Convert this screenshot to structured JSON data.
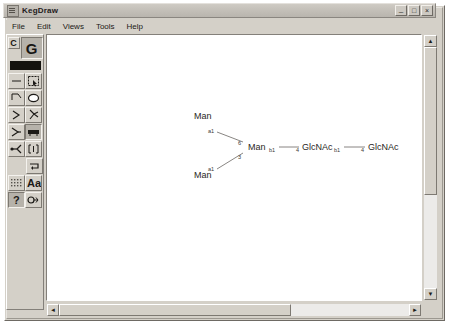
{
  "window": {
    "title": "KegDraw",
    "icon": "app-icon",
    "buttons": {
      "minimize": "–",
      "maximize": "□",
      "close": "×"
    }
  },
  "menubar": {
    "items": [
      {
        "label": "File"
      },
      {
        "label": "Edit"
      },
      {
        "label": "Views"
      },
      {
        "label": "Tools"
      },
      {
        "label": "Help"
      }
    ]
  },
  "toolbar": {
    "mode_compound": "C",
    "mode_glycan": "G",
    "tools": [
      {
        "name": "single-bond-tool",
        "icon": "horizontal-line-icon"
      },
      {
        "name": "select-rectangle-tool",
        "icon": "dashed-rectangle-icon"
      },
      {
        "name": "bond-angle-tool",
        "icon": "corner-bond-icon"
      },
      {
        "name": "ring-tool",
        "icon": "hexagon-ring-icon"
      },
      {
        "name": "branch-tool",
        "icon": "branch-arrow-icon"
      },
      {
        "name": "lasso-tool",
        "icon": "lasso-icon"
      },
      {
        "name": "y-branch-tool",
        "icon": "y-fork-icon"
      },
      {
        "name": "block-tool",
        "icon": "filled-block-icon"
      },
      {
        "name": "arrow-branch-tool",
        "icon": "arrow-fork-icon"
      },
      {
        "name": "bracket-tool",
        "icon": "bracket-icon"
      },
      {
        "name": "repeat-tool",
        "icon": "repeat-arrow-icon"
      },
      {
        "name": "grid-tool",
        "icon": "grid-icon"
      },
      {
        "name": "text-tool",
        "icon": "text-aa-icon"
      },
      {
        "name": "help-tool",
        "icon": "question-mark-icon"
      },
      {
        "name": "node-tool",
        "icon": "node-circle-icon"
      }
    ]
  },
  "canvas": {
    "structure": {
      "type": "glycan",
      "residues": [
        {
          "id": "man-upper",
          "label": "Man",
          "x": 148,
          "y": 81
        },
        {
          "id": "man-lower",
          "label": "Man",
          "x": 148,
          "y": 140
        },
        {
          "id": "man-core",
          "label": "Man",
          "x": 202,
          "y": 111
        },
        {
          "id": "glcnac-1",
          "label": "GlcNAc",
          "x": 258,
          "y": 111
        },
        {
          "id": "glcnac-2",
          "label": "GlcNAc",
          "x": 320,
          "y": 111
        }
      ],
      "linkages": [
        {
          "from": "man-upper",
          "to": "man-core",
          "anomer": "a1",
          "position": "6"
        },
        {
          "from": "man-lower",
          "to": "man-core",
          "anomer": "a1",
          "position": "3"
        },
        {
          "from": "man-core",
          "to": "glcnac-1",
          "anomer": "b1",
          "position": "4"
        },
        {
          "from": "glcnac-1",
          "to": "glcnac-2",
          "anomer": "b1",
          "position": "4"
        }
      ]
    }
  },
  "scrollbars": {
    "vertical": {
      "up": "▲",
      "down": "▼"
    },
    "horizontal": {
      "left": "◄",
      "right": "►"
    }
  }
}
